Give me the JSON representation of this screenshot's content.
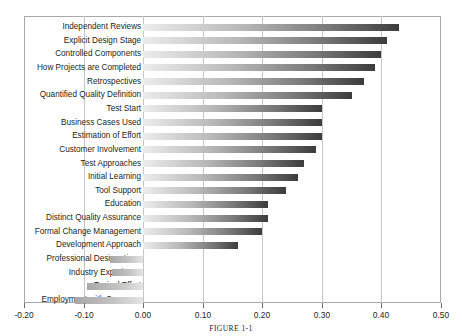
{
  "figure": {
    "caption": "FIGURE 1-1"
  },
  "chart_data": {
    "type": "bar",
    "orientation": "horizontal",
    "title": "",
    "xlabel": "",
    "ylabel": "",
    "xlim": [
      -0.2,
      0.5
    ],
    "xticks": [
      -0.2,
      -0.1,
      0.0,
      0.1,
      0.2,
      0.3,
      0.4,
      0.5
    ],
    "xtick_labels": [
      "-0.20",
      "-0.10",
      "0.00",
      "0.10",
      "0.20",
      "0.30",
      "0.40",
      "0.50"
    ],
    "grid": true,
    "grid_axis": "x",
    "legend": "none",
    "bar_fill": "gradient-light-to-dark",
    "categories": [
      "Independent Reviews",
      "Explicit Design Stage",
      "Controlled Components",
      "How Projects are Completed",
      "Retrospectives",
      "Quantified Quality Definition",
      "Test Start",
      "Business Cases Used",
      "Estimation of Effort",
      "Customer Involvement",
      "Test Approaches",
      "Initial Learning",
      "Tool Support",
      "Education",
      "Distinct Quality Assurance",
      "Formal Change Management",
      "Development Approach",
      "Professional Designations",
      "Industry Experience",
      "Typical Effort",
      "Employment with Company"
    ],
    "values": [
      0.43,
      0.41,
      0.4,
      0.39,
      0.37,
      0.35,
      0.3,
      0.3,
      0.3,
      0.29,
      0.27,
      0.26,
      0.24,
      0.21,
      0.21,
      0.2,
      0.16,
      -0.055,
      -0.052,
      -0.095,
      -0.115
    ]
  },
  "colors": {
    "bar_light": "#ececec",
    "bar_dark": "#3c3c3c",
    "grid": "#c6c6c6",
    "frame": "#a9a9a9",
    "text": "#231f20"
  }
}
